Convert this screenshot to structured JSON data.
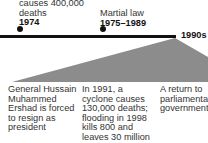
{
  "timeline": {
    "events_top": [
      {
        "text": "causes 400,000",
        "text2": "deaths",
        "year": "1974"
      },
      {
        "text": "Martial law",
        "year": "1975–1989"
      }
    ],
    "period_label": "1990s",
    "details": [
      {
        "lines": [
          "General Hussain",
          "Muhammed",
          "Ershad is forced",
          "to resign as",
          "president"
        ]
      },
      {
        "lines": [
          "In 1991, a",
          "cyclone causes",
          "130,000 deaths;",
          "flooding in 1998",
          "kills 800 and",
          "leaves 30 million",
          "homeless"
        ]
      },
      {
        "lines": [
          "A return to",
          "parliamentary",
          "government"
        ]
      }
    ],
    "colors": {
      "line": "#111111",
      "wedge": "#8a8a8a",
      "text": "#333333"
    }
  }
}
